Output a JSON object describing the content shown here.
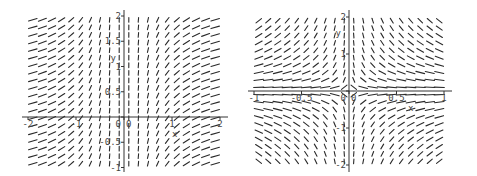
{
  "chart_data": [
    {
      "type": "slope_field",
      "title": "",
      "equation": "dy/dx = 1/x^2",
      "xlabel": "x",
      "ylabel": "y",
      "xlim": [
        -2.1,
        2.1
      ],
      "ylim": [
        -1.05,
        2.05
      ],
      "grid": false,
      "x_ticks": [
        {
          "value": -2,
          "label": "-2"
        },
        {
          "value": -1,
          "label": "-1"
        },
        {
          "value": 0,
          "label": "0"
        },
        {
          "value": 1,
          "label": "1"
        },
        {
          "value": 2,
          "label": "2"
        }
      ],
      "y_ticks": [
        {
          "value": 2,
          "label": "2"
        },
        {
          "value": 1.5,
          "label": "1.5"
        },
        {
          "value": 1,
          "label": "1"
        },
        {
          "value": 0.5,
          "label": "0.5"
        },
        {
          "value": 0,
          "label": "0"
        },
        {
          "value": -0.5,
          "label": "-0.5"
        },
        {
          "value": -1,
          "label": "-1"
        }
      ],
      "field": {
        "kind": "inv_x_squared",
        "cols": 20,
        "rows": 20,
        "x_range": [
          -2,
          2
        ],
        "y_range": [
          -1,
          2
        ]
      },
      "pixel_frame": {
        "x0": 124,
        "y0": 117,
        "px_per_x": 48,
        "px_per_y": 50.5,
        "left": 22,
        "right": 228,
        "top": 10,
        "bottom": 172
      }
    },
    {
      "type": "slope_field",
      "title": "",
      "equation": "dy/dx = -y/x",
      "xlabel": "x",
      "ylabel": "y",
      "xlim": [
        -1.05,
        1.05
      ],
      "ylim": [
        -2.05,
        2.05
      ],
      "grid": false,
      "x_ticks": [
        {
          "value": -1,
          "label": "-1"
        },
        {
          "value": -0.5,
          "label": "-0.5"
        },
        {
          "value": 0,
          "label": "0"
        },
        {
          "value": 0.5,
          "label": "0.5"
        },
        {
          "value": 1,
          "label": "1"
        }
      ],
      "y_ticks": [
        {
          "value": 2,
          "label": "2"
        },
        {
          "value": 1,
          "label": "1"
        },
        {
          "value": 0,
          "label": "0"
        },
        {
          "value": -1,
          "label": "-1"
        },
        {
          "value": -2,
          "label": "-2"
        }
      ],
      "field": {
        "kind": "neg_y_over_x",
        "cols": 20,
        "rows": 20,
        "x_range": [
          -1,
          1
        ],
        "y_range": [
          -2,
          2
        ]
      },
      "pixel_frame": {
        "x0": 109,
        "y0": 91,
        "px_per_x": 95,
        "px_per_y": 37,
        "left": 8,
        "right": 212,
        "top": 10,
        "bottom": 172
      }
    }
  ],
  "plots": {
    "left": {
      "xlabel": "x",
      "ylabel": "y",
      "origin_label": "0"
    },
    "right": {
      "xlabel": "x",
      "ylabel": "y",
      "origin_label": "0"
    }
  },
  "colors": {
    "segment": "#2a2a2a",
    "axis": "#333333",
    "label": "#444444",
    "background": "#ffffff"
  }
}
